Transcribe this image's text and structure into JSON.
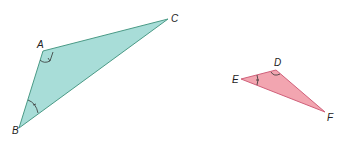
{
  "diagram": {
    "triangles": [
      {
        "name": "ABC",
        "fill": "#a8ddd8",
        "stroke": "#4a9a86",
        "vertices": {
          "A": [
            43,
            51
          ],
          "B": [
            19,
            128
          ],
          "C": [
            168,
            19
          ]
        },
        "marked_angles": [
          "A",
          "B"
        ]
      },
      {
        "name": "DEF",
        "fill": "#f2a5b0",
        "stroke": "#d0607a",
        "vertices": {
          "D": [
            276,
            70
          ],
          "E": [
            241,
            79
          ],
          "F": [
            325,
            112
          ]
        },
        "marked_angles": [
          "D",
          "E"
        ]
      }
    ],
    "labels": {
      "A": "A",
      "B": "B",
      "C": "C",
      "D": "D",
      "E": "E",
      "F": "F"
    }
  }
}
